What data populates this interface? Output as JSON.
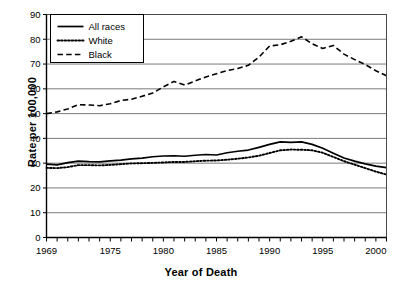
{
  "chart_data": {
    "type": "line",
    "title": "",
    "xlabel": "Year of Death",
    "ylabel": "Rate per 100,000",
    "xlim": [
      1969,
      2001
    ],
    "ylim": [
      0,
      90
    ],
    "ytick_step": 10,
    "xtick_step": 1,
    "grid": "horizontal",
    "legend_position": "top-left",
    "x": [
      1969,
      1970,
      1971,
      1972,
      1973,
      1974,
      1975,
      1976,
      1977,
      1978,
      1979,
      1980,
      1981,
      1982,
      1983,
      1984,
      1985,
      1986,
      1987,
      1988,
      1989,
      1990,
      1991,
      1992,
      1993,
      1994,
      1995,
      1996,
      1997,
      1998,
      1999,
      2000,
      2001
    ],
    "x_tick_labels": [
      "1969",
      "1975",
      "1980",
      "1985",
      "1990",
      "1995",
      "2000"
    ],
    "x_tick_label_values": [
      1969,
      1975,
      1980,
      1985,
      1990,
      1995,
      2000
    ],
    "y_tick_labels": [
      "0",
      "10",
      "20",
      "30",
      "40",
      "50",
      "60",
      "70",
      "80",
      "90"
    ],
    "series": [
      {
        "name": "All races",
        "style": "solid",
        "color": "#000000",
        "values": [
          29.6,
          29.3,
          30.2,
          30.8,
          30.6,
          30.5,
          30.9,
          31.2,
          31.7,
          32.0,
          32.6,
          32.9,
          33.0,
          32.8,
          33.2,
          33.5,
          33.3,
          34.2,
          34.8,
          35.3,
          36.4,
          37.6,
          38.6,
          38.4,
          38.6,
          37.6,
          36.0,
          34.0,
          32.1,
          30.8,
          29.7,
          28.8,
          28.2
        ]
      },
      {
        "name": "White",
        "style": "dotted",
        "color": "#000000",
        "values": [
          28.1,
          28.0,
          28.4,
          29.2,
          29.2,
          29.1,
          29.3,
          29.6,
          29.9,
          30.0,
          30.1,
          30.3,
          30.5,
          30.5,
          30.8,
          31.0,
          31.1,
          31.4,
          31.8,
          32.3,
          33.0,
          34.1,
          35.2,
          35.5,
          35.4,
          35.2,
          34.2,
          32.5,
          30.8,
          29.4,
          28.0,
          26.6,
          25.4
        ]
      },
      {
        "name": "Black",
        "style": "dashed",
        "color": "#000000",
        "values": [
          50.0,
          50.7,
          51.9,
          53.6,
          53.5,
          53.2,
          54.0,
          55.3,
          55.8,
          57.0,
          58.3,
          60.8,
          63.0,
          61.5,
          63.2,
          64.8,
          66.1,
          67.4,
          68.2,
          69.5,
          72.8,
          77.3,
          77.8,
          79.2,
          81.0,
          78.2,
          76.3,
          77.5,
          74.0,
          71.8,
          69.8,
          67.3,
          65.3
        ]
      }
    ]
  },
  "legend": {
    "entries": [
      {
        "label": "All races",
        "style": "solid"
      },
      {
        "label": "White",
        "style": "dotted"
      },
      {
        "label": "Black",
        "style": "dashed"
      }
    ]
  },
  "axes": {
    "x_title": "Year of Death",
    "y_title": "Rate per 100,000"
  }
}
